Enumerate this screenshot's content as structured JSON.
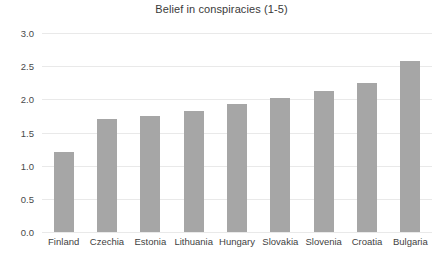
{
  "chart_data": {
    "type": "bar",
    "title": "Belief in conspiracies (1-5)",
    "xlabel": "",
    "ylabel": "",
    "categories": [
      "Finland",
      "Czechia",
      "Estonia",
      "Lithuania",
      "Hungary",
      "Slovakia",
      "Slovenia",
      "Croatia",
      "Bulgaria"
    ],
    "values": [
      1.2,
      1.7,
      1.75,
      1.82,
      1.93,
      2.02,
      2.13,
      2.25,
      2.58
    ],
    "ylim": [
      0.0,
      3.0
    ],
    "ytick_labels": [
      "0.0",
      "0.5",
      "1.0",
      "1.5",
      "2.0",
      "2.5",
      "3.0"
    ],
    "ytick_values": [
      0.0,
      0.5,
      1.0,
      1.5,
      2.0,
      2.5,
      3.0
    ],
    "grid": true,
    "legend": false,
    "bar_color": "#a6a6a6",
    "gridline_color": "#e9e9e9",
    "background_color": "#ffffff"
  }
}
